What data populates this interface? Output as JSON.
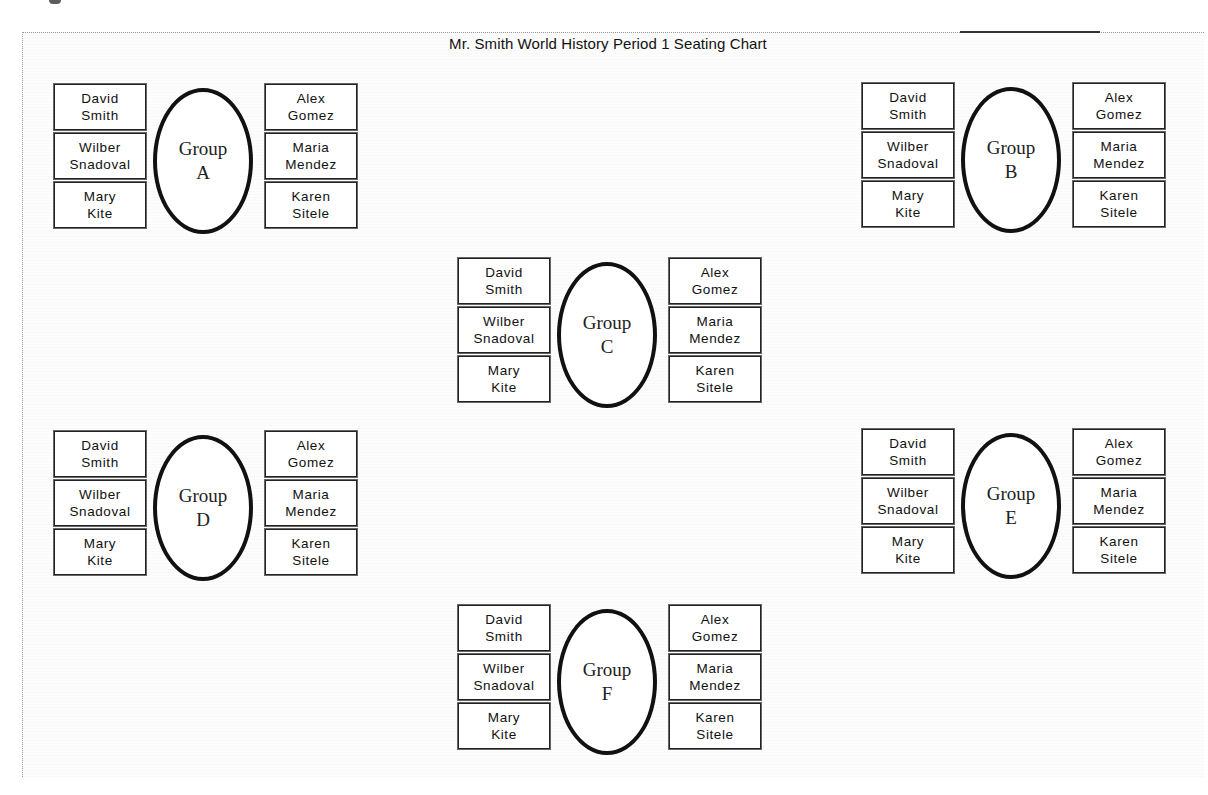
{
  "title": "Mr. Smith World History Period 1 Seating Chart",
  "colors": {
    "border": "#222222",
    "ellipse": "#111111",
    "background": "#ffffff",
    "frame": "#9a9a9a"
  },
  "groups": [
    {
      "id": "A",
      "label": "Group",
      "letter": "A",
      "left_seats": [
        {
          "first": "David",
          "last": "Smith"
        },
        {
          "first": "Wilber",
          "last": "Snadoval"
        },
        {
          "first": "Mary",
          "last": "Kite"
        }
      ],
      "right_seats": [
        {
          "first": "Alex",
          "last": "Gomez"
        },
        {
          "first": "Maria",
          "last": "Mendez"
        },
        {
          "first": "Karen",
          "last": "Sitele"
        }
      ]
    },
    {
      "id": "B",
      "label": "Group",
      "letter": "B",
      "left_seats": [
        {
          "first": "David",
          "last": "Smith"
        },
        {
          "first": "Wilber",
          "last": "Snadoval"
        },
        {
          "first": "Mary",
          "last": "Kite"
        }
      ],
      "right_seats": [
        {
          "first": "Alex",
          "last": "Gomez"
        },
        {
          "first": "Maria",
          "last": "Mendez"
        },
        {
          "first": "Karen",
          "last": "Sitele"
        }
      ]
    },
    {
      "id": "C",
      "label": "Group",
      "letter": "C",
      "left_seats": [
        {
          "first": "David",
          "last": "Smith"
        },
        {
          "first": "Wilber",
          "last": "Snadoval"
        },
        {
          "first": "Mary",
          "last": "Kite"
        }
      ],
      "right_seats": [
        {
          "first": "Alex",
          "last": "Gomez"
        },
        {
          "first": "Maria",
          "last": "Mendez"
        },
        {
          "first": "Karen",
          "last": "Sitele"
        }
      ]
    },
    {
      "id": "D",
      "label": "Group",
      "letter": "D",
      "left_seats": [
        {
          "first": "David",
          "last": "Smith"
        },
        {
          "first": "Wilber",
          "last": "Snadoval"
        },
        {
          "first": "Mary",
          "last": "Kite"
        }
      ],
      "right_seats": [
        {
          "first": "Alex",
          "last": "Gomez"
        },
        {
          "first": "Maria",
          "last": "Mendez"
        },
        {
          "first": "Karen",
          "last": "Sitele"
        }
      ]
    },
    {
      "id": "E",
      "label": "Group",
      "letter": "E",
      "left_seats": [
        {
          "first": "David",
          "last": "Smith"
        },
        {
          "first": "Wilber",
          "last": "Snadoval"
        },
        {
          "first": "Mary",
          "last": "Kite"
        }
      ],
      "right_seats": [
        {
          "first": "Alex",
          "last": "Gomez"
        },
        {
          "first": "Maria",
          "last": "Mendez"
        },
        {
          "first": "Karen",
          "last": "Sitele"
        }
      ]
    },
    {
      "id": "F",
      "label": "Group",
      "letter": "F",
      "left_seats": [
        {
          "first": "David",
          "last": "Smith"
        },
        {
          "first": "Wilber",
          "last": "Snadoval"
        },
        {
          "first": "Mary",
          "last": "Kite"
        }
      ],
      "right_seats": [
        {
          "first": "Alex",
          "last": "Gomez"
        },
        {
          "first": "Maria",
          "last": "Mendez"
        },
        {
          "first": "Karen",
          "last": "Sitele"
        }
      ]
    }
  ]
}
